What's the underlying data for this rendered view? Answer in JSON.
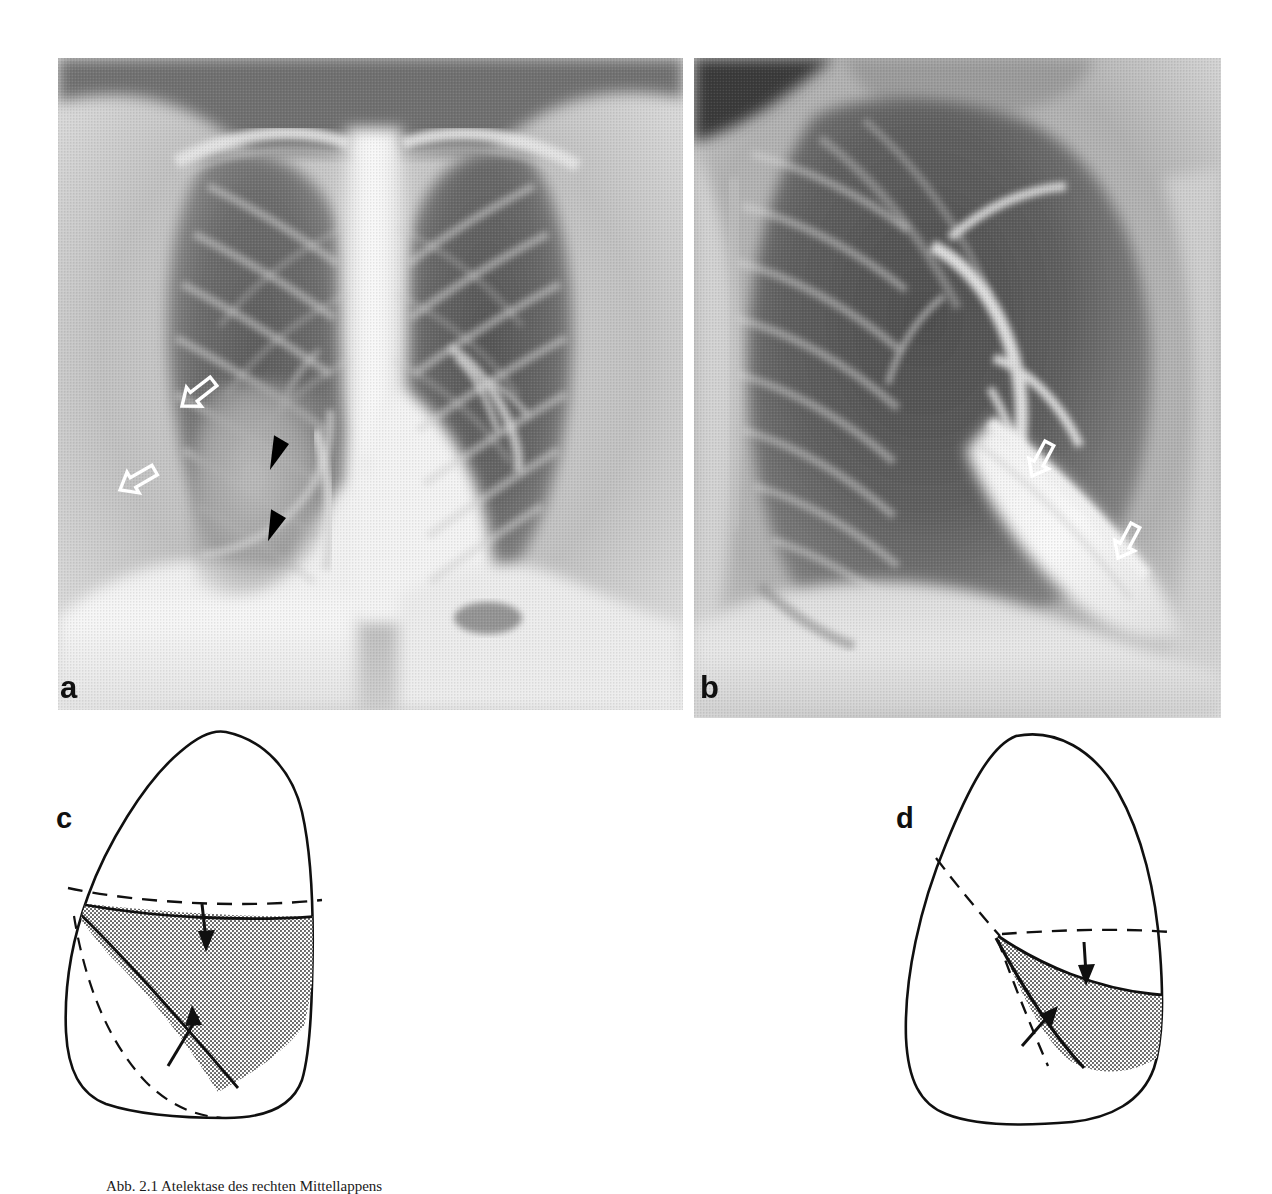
{
  "figure": {
    "kind": "medical-radiograph-figure",
    "panel_count": 4,
    "caption": "Abb. 2.1  Atelektase des rechten Mittellappens"
  },
  "panels": [
    {
      "id": "a",
      "label": "a",
      "type": "radiograph",
      "view": "PA chest radiograph",
      "markers": [
        {
          "name": "open-arrow-upper",
          "style": "white-open-arrow",
          "points": "upper-left"
        },
        {
          "name": "open-arrow-lower",
          "style": "white-open-arrow",
          "points": "upper-left"
        },
        {
          "name": "arrowhead-upper",
          "style": "solid-black-arrowhead",
          "points": "down-left"
        },
        {
          "name": "arrowhead-lower",
          "style": "solid-black-arrowhead",
          "points": "down-left"
        }
      ]
    },
    {
      "id": "b",
      "label": "b",
      "type": "radiograph",
      "view": "Lateral chest radiograph",
      "markers": [
        {
          "name": "open-arrow-upper",
          "style": "white-open-arrow",
          "points": "left"
        },
        {
          "name": "open-arrow-lower",
          "style": "white-open-arrow",
          "points": "left"
        }
      ]
    },
    {
      "id": "c",
      "label": "c",
      "type": "schematic",
      "view": "Frontal lung schematic",
      "markers": [
        {
          "name": "arrow-down",
          "style": "solid-black-arrow",
          "points": "down"
        },
        {
          "name": "arrow-up",
          "style": "solid-black-arrow",
          "points": "up-right"
        }
      ],
      "features": [
        "lung-outline",
        "dashed-minor-fissure",
        "shaded-collapsed-lobe",
        "dashed-normal-lobe-border"
      ]
    },
    {
      "id": "d",
      "label": "d",
      "type": "schematic",
      "view": "Lateral lung schematic",
      "markers": [
        {
          "name": "arrow-down",
          "style": "solid-black-arrow",
          "points": "down"
        },
        {
          "name": "arrow-up",
          "style": "solid-black-arrow",
          "points": "up-right"
        }
      ],
      "features": [
        "lung-outline",
        "dashed-oblique-fissure",
        "dashed-minor-fissure",
        "shaded-collapsed-lobe"
      ]
    }
  ],
  "colors": {
    "ink": "#101010",
    "shading": "#b3b3b3",
    "paper": "#ffffff",
    "marker_white": "#ffffff",
    "marker_black": "#000000"
  }
}
